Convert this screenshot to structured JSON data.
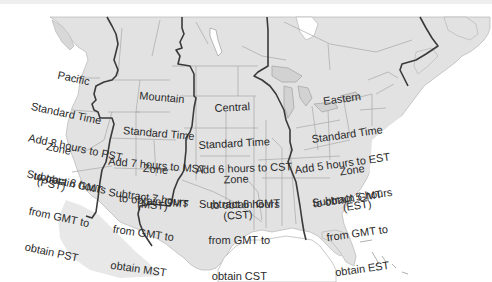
{
  "colors": {
    "land": "#e2e2e2",
    "land_dark": "#d2d2d2",
    "water": "#ffffff",
    "state_border": "#a8a8a8",
    "zone_border": "#3a3a3a",
    "text": "#2a2a2a"
  },
  "zones": [
    {
      "id": "pacific",
      "name": [
        "Pacific",
        "Standard Time",
        "Zone",
        "(PST)"
      ],
      "to_gmt": [
        "Add 8 hours to PST",
        "to obtain GMT"
      ],
      "from_gmt": [
        "Subtract 8 hours",
        "from GMT to",
        "obtain PST"
      ],
      "offset_hours": 8
    },
    {
      "id": "mountain",
      "name": [
        "Mountain",
        "Standard Time",
        "Zone",
        "(MST)"
      ],
      "to_gmt": [
        "Add 7 hours to MST",
        "to obtain GMT"
      ],
      "from_gmt": [
        "Subtract 7 hours",
        "from GMT to",
        "obtain MST"
      ],
      "offset_hours": 7
    },
    {
      "id": "central",
      "name": [
        "Central",
        "Standard Time",
        "Zone",
        "(CST)"
      ],
      "to_gmt": [
        "Add 6 hours to CST",
        "to obtain GMT"
      ],
      "from_gmt": [
        "Subtract 6 hours",
        "from GMT to",
        "obtain CST"
      ],
      "offset_hours": 6
    },
    {
      "id": "eastern",
      "name": [
        "Eastern",
        "Standard Time",
        "Zone",
        "(EST)"
      ],
      "to_gmt": [
        "Add 5 hours to EST",
        "to obtain GMT"
      ],
      "from_gmt": [
        "Subtract 5 hours",
        "from GMT to",
        "obtain EST"
      ],
      "offset_hours": 5
    }
  ]
}
